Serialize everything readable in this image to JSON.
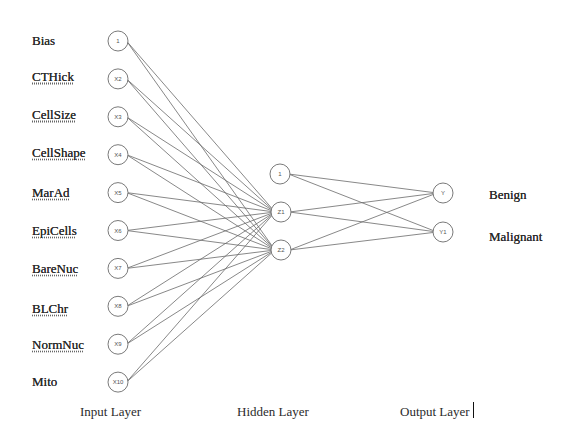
{
  "diagram": {
    "type": "neural-network",
    "layers": {
      "input": {
        "title": "Input Layer",
        "nodes": [
          {
            "id": "1",
            "feature": "Bias",
            "spell_underline": false
          },
          {
            "id": "X2",
            "feature": "CTHick",
            "spell_underline": true
          },
          {
            "id": "X3",
            "feature": "CellSize",
            "spell_underline": true
          },
          {
            "id": "X4",
            "feature": "CellShape",
            "spell_underline": true
          },
          {
            "id": "X5",
            "feature": "MarAd",
            "spell_underline": true
          },
          {
            "id": "X6",
            "feature": "EpiCells",
            "spell_underline": true
          },
          {
            "id": "X7",
            "feature": "BareNuc",
            "spell_underline": true
          },
          {
            "id": "X8",
            "feature": "BLChr",
            "spell_underline": true
          },
          {
            "id": "X9",
            "feature": "NormNuc",
            "spell_underline": true
          },
          {
            "id": "X10",
            "feature": "Mito",
            "spell_underline": false
          }
        ]
      },
      "hidden": {
        "title": "Hidden Layer",
        "nodes": [
          {
            "id": "1"
          },
          {
            "id": "Z1"
          },
          {
            "id": "Z2"
          }
        ]
      },
      "output": {
        "title": "Output Layer",
        "nodes": [
          {
            "id": "Y",
            "class_label": "Benign"
          },
          {
            "id": "Y1",
            "class_label": "Malignant"
          }
        ]
      }
    },
    "connections": {
      "input_to_hidden": "every input node connects to Z1 and Z2",
      "hidden_to_output": "every hidden node connects to Y and Y1"
    },
    "colors": {
      "edge": "#6a6a6a",
      "node_stroke": "#7a7a7a",
      "text": "#2b2b2b",
      "background": "#ffffff"
    }
  }
}
